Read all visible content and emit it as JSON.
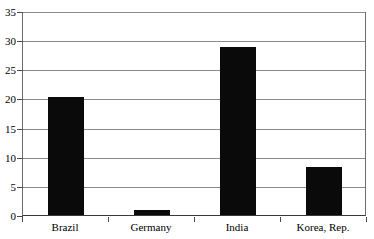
{
  "chart_data": {
    "type": "bar",
    "title": "",
    "xlabel": "",
    "ylabel": "",
    "categories": [
      "Brazil",
      "Germany",
      "India",
      "Korea, Rep."
    ],
    "values": [
      20.3,
      0.9,
      28.8,
      8.3
    ],
    "ylim": [
      0,
      35
    ],
    "yticks": [
      0,
      5,
      10,
      15,
      20,
      25,
      30,
      35
    ],
    "ytick_labels": [
      "0",
      "5",
      "10",
      "15",
      "20",
      "25",
      "30",
      "35"
    ],
    "grid": "horizontal",
    "legend": "none",
    "bar_color": "#0a0a0a",
    "gridline_color": "#8a8a8a",
    "axis_color": "#3a3a3a",
    "series": [
      {
        "name": "",
        "values": [
          20.3,
          0.9,
          28.8,
          8.3
        ]
      }
    ]
  },
  "figure": {
    "cropped_title": "",
    "background": "#ffffff"
  }
}
